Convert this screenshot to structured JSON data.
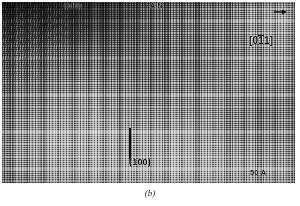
{
  "figure": {
    "caption": "(b)",
    "type": "high-resolution transmission electron micrograph"
  },
  "micrograph": {
    "labels": {
      "left_material": "CdTe",
      "right_material": "AlN",
      "zone_axis_prefix": "[0",
      "zone_axis_barred": "1",
      "zone_axis_suffix": "1]",
      "zone_axis_full": "[011]",
      "plane": "(100)",
      "scale_bar": "50 A"
    },
    "icons": {
      "direction_arrow": "arrow-right-icon"
    },
    "colors": {
      "plate_mid_tone": "#9a9a9a",
      "plate_dark_tone": "#141414",
      "plate_light_tone": "#e0e0e0",
      "annotation_ink": "#0d0d0d",
      "caption_ink": "#2a2a2a"
    }
  }
}
